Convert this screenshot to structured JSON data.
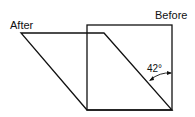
{
  "diagram": {
    "labels": {
      "before": "Before",
      "after": "After",
      "angle": "42°"
    },
    "shapes": {
      "before_square": {
        "x": 87,
        "y": 25,
        "width": 85,
        "height": 85
      },
      "after_parallelogram": {
        "points": [
          [
            21,
            33
          ],
          [
            104,
            33
          ],
          [
            172,
            110
          ],
          [
            87,
            110
          ]
        ]
      }
    },
    "angle_degrees": 42,
    "stroke_color": "#111111"
  }
}
